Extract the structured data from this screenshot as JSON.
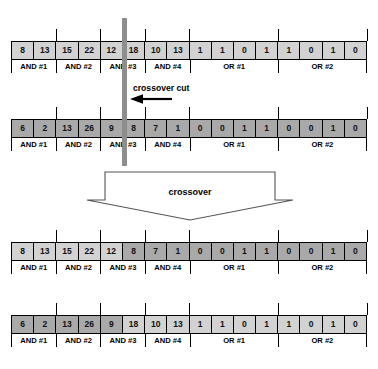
{
  "figure": {
    "cut_label": "crossover cut",
    "crossover_label": "crossover",
    "colors": {
      "cell_light": "#d2d2d2",
      "cell_dark": "#a9a9a9",
      "cut_bar": "#8e8e8e",
      "outline": "#000000"
    },
    "group_labels": [
      "AND #1",
      "AND #2",
      "AND #3",
      "AND #4",
      "OR #1",
      "OR #2"
    ],
    "group_spans": [
      2,
      2,
      2,
      2,
      4,
      4
    ],
    "rows": [
      {
        "id": "parent-1",
        "role": "parent",
        "cells": [
          {
            "value": "8",
            "shade": "light"
          },
          {
            "value": "13",
            "shade": "light"
          },
          {
            "value": "15",
            "shade": "light"
          },
          {
            "value": "22",
            "shade": "light"
          },
          {
            "value": "12",
            "shade": "light"
          },
          {
            "value": "18",
            "shade": "light"
          },
          {
            "value": "10",
            "shade": "light"
          },
          {
            "value": "13",
            "shade": "light"
          },
          {
            "value": "1",
            "shade": "light"
          },
          {
            "value": "1",
            "shade": "light"
          },
          {
            "value": "0",
            "shade": "light"
          },
          {
            "value": "1",
            "shade": "light"
          },
          {
            "value": "1",
            "shade": "light"
          },
          {
            "value": "0",
            "shade": "light"
          },
          {
            "value": "1",
            "shade": "light"
          },
          {
            "value": "0",
            "shade": "light"
          }
        ]
      },
      {
        "id": "parent-2",
        "role": "parent",
        "cells": [
          {
            "value": "6",
            "shade": "dark"
          },
          {
            "value": "2",
            "shade": "dark"
          },
          {
            "value": "13",
            "shade": "dark"
          },
          {
            "value": "26",
            "shade": "dark"
          },
          {
            "value": "9",
            "shade": "dark"
          },
          {
            "value": "8",
            "shade": "dark"
          },
          {
            "value": "7",
            "shade": "dark"
          },
          {
            "value": "1",
            "shade": "dark"
          },
          {
            "value": "0",
            "shade": "dark"
          },
          {
            "value": "0",
            "shade": "dark"
          },
          {
            "value": "1",
            "shade": "dark"
          },
          {
            "value": "1",
            "shade": "dark"
          },
          {
            "value": "0",
            "shade": "dark"
          },
          {
            "value": "0",
            "shade": "dark"
          },
          {
            "value": "1",
            "shade": "dark"
          },
          {
            "value": "0",
            "shade": "dark"
          }
        ]
      },
      {
        "id": "child-1",
        "role": "child",
        "cells": [
          {
            "value": "8",
            "shade": "light"
          },
          {
            "value": "13",
            "shade": "light"
          },
          {
            "value": "15",
            "shade": "light"
          },
          {
            "value": "22",
            "shade": "light"
          },
          {
            "value": "12",
            "shade": "light"
          },
          {
            "value": "8",
            "shade": "dark"
          },
          {
            "value": "7",
            "shade": "dark"
          },
          {
            "value": "1",
            "shade": "dark"
          },
          {
            "value": "0",
            "shade": "dark"
          },
          {
            "value": "0",
            "shade": "dark"
          },
          {
            "value": "1",
            "shade": "dark"
          },
          {
            "value": "1",
            "shade": "dark"
          },
          {
            "value": "0",
            "shade": "dark"
          },
          {
            "value": "0",
            "shade": "dark"
          },
          {
            "value": "1",
            "shade": "dark"
          },
          {
            "value": "0",
            "shade": "dark"
          }
        ]
      },
      {
        "id": "child-2",
        "role": "child",
        "cells": [
          {
            "value": "6",
            "shade": "dark"
          },
          {
            "value": "2",
            "shade": "dark"
          },
          {
            "value": "13",
            "shade": "dark"
          },
          {
            "value": "26",
            "shade": "dark"
          },
          {
            "value": "9",
            "shade": "dark"
          },
          {
            "value": "18",
            "shade": "light"
          },
          {
            "value": "10",
            "shade": "light"
          },
          {
            "value": "13",
            "shade": "light"
          },
          {
            "value": "1",
            "shade": "light"
          },
          {
            "value": "1",
            "shade": "light"
          },
          {
            "value": "0",
            "shade": "light"
          },
          {
            "value": "1",
            "shade": "light"
          },
          {
            "value": "1",
            "shade": "light"
          },
          {
            "value": "0",
            "shade": "light"
          },
          {
            "value": "1",
            "shade": "light"
          },
          {
            "value": "0",
            "shade": "light"
          }
        ]
      }
    ]
  }
}
